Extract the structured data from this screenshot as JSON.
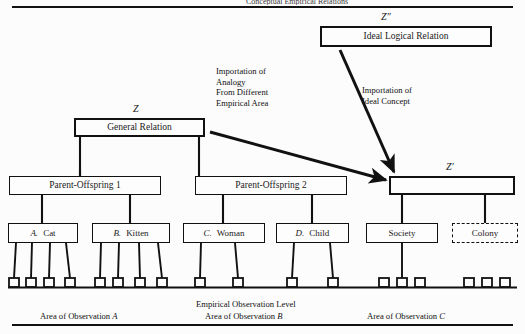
{
  "page": {
    "header_text": "Conceptual Empirical Relations",
    "background": "#fcfcfc",
    "ink": "#111111"
  },
  "nodes": {
    "ideal_logical_relation": {
      "label": "Ideal Logical Relation",
      "tag": "Z″"
    },
    "general_relation": {
      "label": "General Relation",
      "tag": "Z"
    },
    "social_relation": {
      "label": "",
      "tag": "Z′"
    },
    "parent_offspring_1": {
      "label": "Parent-Offspring 1"
    },
    "parent_offspring_2": {
      "label": "Parent-Offspring 2"
    }
  },
  "leaves": [
    {
      "letter": "A.",
      "label": "Cat",
      "legs": 4,
      "style": "solid"
    },
    {
      "letter": "B.",
      "label": "Kitten",
      "legs": 4,
      "style": "solid"
    },
    {
      "letter": "C.",
      "label": "Woman",
      "legs": 2,
      "style": "solid"
    },
    {
      "letter": "D.",
      "label": "Child",
      "legs": 2,
      "style": "solid"
    },
    {
      "letter": "",
      "label": "Society",
      "legs": 3,
      "style": "solid"
    },
    {
      "letter": "",
      "label": "Colony",
      "legs": 3,
      "style": "dashed"
    }
  ],
  "annotations": {
    "analogy": "Importation of\nAnalogy\nFrom Different\nEmpirical Area",
    "analogy_lines": [
      "Importation of",
      "Analogy",
      "From Different",
      "Empirical Area"
    ],
    "ideal": "Importation of\nIdeal Concept",
    "ideal_lines": [
      "Importation of",
      "Ideal Concept"
    ]
  },
  "footer": {
    "level_label": "Empirical  Observation  Level",
    "areas": [
      {
        "prefix": "Area of Observation ",
        "letter": "A"
      },
      {
        "prefix": "Area of Observation ",
        "letter": "B"
      },
      {
        "prefix": "Area of Observation ",
        "letter": "C"
      }
    ]
  }
}
